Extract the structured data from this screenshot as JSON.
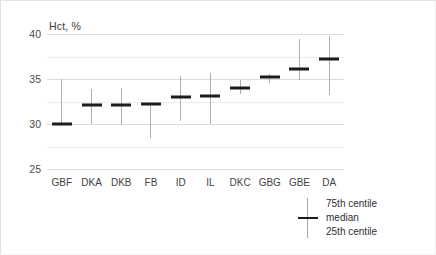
{
  "chart_data": {
    "type": "box",
    "title": "",
    "subtitle": "",
    "xlabel": "",
    "ylabel": "Hct, %",
    "ylim": [
      25,
      40
    ],
    "yticks": [
      40,
      35,
      30,
      25
    ],
    "minor_yticks": [
      37.5,
      32.5,
      27.5
    ],
    "grid": true,
    "legend_position": "bottom-right",
    "categories": [
      "GBF",
      "DKA",
      "DKB",
      "FB",
      "ID",
      "IL",
      "DKC",
      "GBG",
      "GBE",
      "DA"
    ],
    "series": [
      {
        "name": "median",
        "values": [
          30.0,
          32.1,
          32.1,
          32.2,
          33.0,
          33.1,
          34.0,
          35.2,
          36.1,
          37.2
        ]
      },
      {
        "name": "75th centile",
        "values": [
          35.0,
          33.9,
          34.0,
          32.3,
          35.3,
          35.7,
          34.9,
          35.6,
          39.4,
          39.8
        ]
      },
      {
        "name": "25th centile",
        "values": [
          29.8,
          30.0,
          29.9,
          28.4,
          30.3,
          30.0,
          33.3,
          34.5,
          34.9,
          33.2
        ]
      }
    ],
    "annotations": []
  },
  "yaxis": {
    "title": "Hct, %",
    "ticks": [
      "40",
      "35",
      "30",
      "25"
    ]
  },
  "legend": {
    "glyph": "cross-whisker-icon",
    "entries": [
      "75th centile",
      "median",
      "25th centile"
    ]
  },
  "colors": {
    "median": "#1d1d1d",
    "whisker": "#b0b0b0",
    "gridline": "#dcdcdc",
    "gridline_minor": "#ededed",
    "background": "#ffffff",
    "text": "#3f3f3f"
  }
}
